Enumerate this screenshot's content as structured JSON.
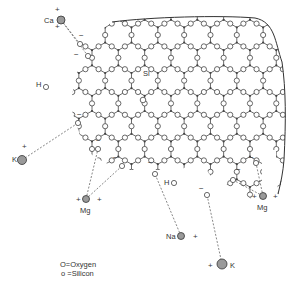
{
  "diagram": {
    "colors": {
      "line": "#444444",
      "atom_stroke": "#444444",
      "cation_fill": "#9a9a9a",
      "dash": "#555555",
      "text": "#333333"
    },
    "network": {
      "hex_size": 15.2,
      "origin": [
        92,
        35
      ],
      "cols": 9,
      "rows": 7,
      "clip_path": "M 112 22 C 150 17 220 15 255 18 C 275 22 275 42 282 62 C 286 90 286 120 284 160 C 283 175 281 185 278 195 L 276 150 L 262 150 L 262 205 L 210 175 L 200 160 L 180 170 L 150 170 L 120 170 L 100 160 L 85 150 L 80 135 L 75 120 L 70 105 L 75 80 L 80 60 L 80 45 L 95 35 Z",
      "boundary_path": "M 112 22 C 150 17 220 15 255 18 C 275 22 275 42 282 62 C 286 90 286 120 284 160 C 283 172 281 182 278 194"
    },
    "labels": {
      "si": "Si",
      "h_left": "H",
      "h_right": "H",
      "minus": "−",
      "plus": "+"
    },
    "cations": [
      {
        "id": "ca",
        "label": "Ca",
        "x": 61,
        "y": 20,
        "r": 4,
        "charges": [
          "+",
          "+"
        ],
        "label_pos": [
          44,
          23
        ],
        "plus_pos": [
          [
            55,
            12
          ],
          [
            55,
            29
          ]
        ],
        "bonds": [
          [
            80,
            44
          ],
          [
            88,
            56
          ]
        ]
      },
      {
        "id": "k-left",
        "label": "K",
        "x": 22,
        "y": 160,
        "r": 4.5,
        "charges": [
          "+"
        ],
        "label_pos": [
          12,
          162
        ],
        "plus_pos": [
          [
            22,
            149
          ]
        ],
        "bonds": [
          [
            78,
            123
          ]
        ]
      },
      {
        "id": "mg-left",
        "label": "Mg",
        "x": 86,
        "y": 199,
        "r": 3.5,
        "charges": [
          "+",
          "+"
        ],
        "label_pos": [
          80,
          213
        ],
        "plus_pos": [
          [
            76,
            202
          ],
          [
            97,
            202
          ]
        ],
        "bonds": [
          [
            98,
            149
          ],
          [
            122,
            166
          ]
        ]
      },
      {
        "id": "na",
        "label": "Na",
        "x": 181,
        "y": 236,
        "r": 3.5,
        "charges": [
          "+"
        ],
        "label_pos": [
          166,
          239
        ],
        "plus_pos": [
          [
            193,
            239
          ]
        ],
        "bonds": [
          [
            155,
            174
          ]
        ]
      },
      {
        "id": "k-bottom",
        "label": "K",
        "x": 222,
        "y": 264,
        "r": 5,
        "charges": [
          "+"
        ],
        "label_pos": [
          230,
          268
        ],
        "plus_pos": [
          [
            208,
            268
          ]
        ],
        "bonds": [
          [
            207,
            195
          ]
        ]
      },
      {
        "id": "mg-right",
        "label": "Mg",
        "x": 263,
        "y": 196,
        "r": 3.5,
        "charges": [
          "+",
          "+"
        ],
        "label_pos": [
          257,
          210
        ],
        "plus_pos": [
          [
            252,
            199
          ],
          [
            273,
            199
          ]
        ],
        "bonds": [
          [
            256,
            163
          ],
          [
            233,
            180
          ]
        ]
      }
    ],
    "nonbridging_oxygens": [
      {
        "x": 80,
        "y": 44,
        "minus_pos": [
          79,
          38
        ]
      },
      {
        "x": 88,
        "y": 56,
        "minus_pos": [
          74,
          57
        ]
      },
      {
        "x": 78,
        "y": 123,
        "minus_pos": [
          77,
          117
        ]
      },
      {
        "x": 98,
        "y": 149,
        "minus_pos": [
          96,
          143
        ]
      },
      {
        "x": 122,
        "y": 166,
        "minus_pos": [
          113,
          160
        ]
      },
      {
        "x": 155,
        "y": 174,
        "minus_pos": [
          148,
          165
        ]
      },
      {
        "x": 207,
        "y": 195,
        "minus_pos": [
          199,
          191
        ]
      },
      {
        "x": 256,
        "y": 163,
        "minus_pos": [
          249,
          160
        ]
      },
      {
        "x": 233,
        "y": 180,
        "minus_pos": [
          236,
          172
        ]
      }
    ],
    "hydroxyls": [
      {
        "h_pos": [
          36,
          87
        ],
        "o": [
          46,
          87
        ]
      },
      {
        "h_pos": [
          164,
          185
        ],
        "o": [
          174,
          183
        ]
      }
    ],
    "si_label_pos": [
      143,
      76
    ],
    "si_marker": {
      "x": 143,
      "y": 100,
      "r": 2.8
    },
    "legend": {
      "oxygen": {
        "symbol": "O",
        "text": "=Oxygen",
        "x": 60,
        "y": 267
      },
      "silicon": {
        "symbol": "o",
        "text": " =Silicon",
        "x": 61,
        "y": 276
      }
    }
  }
}
